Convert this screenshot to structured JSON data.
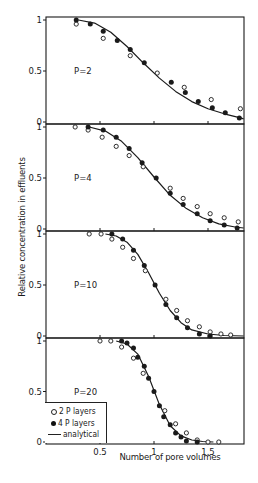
{
  "chart_data": {
    "type": "scatter",
    "title": "",
    "xlabel": "Number of pore volumes",
    "ylabel": "Relative concentration in effluents",
    "xlim": [
      0,
      1.83
    ],
    "ylim": [
      0,
      1
    ],
    "x_ticks": [
      0.5,
      1,
      1.5
    ],
    "x_tick_labels": [
      "0.5",
      "1",
      "1.5"
    ],
    "y_ticks": [
      0,
      0.5,
      1
    ],
    "y_tick_labels": [
      "0",
      "0.5",
      "1"
    ],
    "grid": false,
    "legend": {
      "position": "lower-left of bottom panel",
      "entries": [
        {
          "marker": "open-circle",
          "label": "2 P layers"
        },
        {
          "marker": "filled-circle",
          "label": "4 P layers"
        },
        {
          "marker": "line",
          "label": "analytical"
        }
      ]
    },
    "panels": [
      {
        "label": "P=2",
        "series": [
          {
            "name": "2 P layers",
            "marker": "open",
            "x": [
              0.28,
              0.53,
              0.78,
              1.03,
              1.28,
              1.53,
              1.8
            ],
            "y": [
              0.96,
              0.82,
              0.65,
              0.48,
              0.34,
              0.22,
              0.13
            ]
          },
          {
            "name": "4 P layers",
            "marker": "filled",
            "x": [
              0.28,
              0.41,
              0.53,
              0.66,
              0.78,
              0.91,
              1.16,
              1.29,
              1.41,
              1.54,
              1.66,
              1.79
            ],
            "y": [
              1.0,
              0.96,
              0.89,
              0.8,
              0.71,
              0.58,
              0.39,
              0.29,
              0.2,
              0.14,
              0.09,
              0.04
            ]
          },
          {
            "name": "analytical",
            "marker": "line",
            "x": [
              0.3,
              0.45,
              0.6,
              0.75,
              0.9,
              1.05,
              1.2,
              1.35,
              1.5,
              1.65,
              1.8,
              1.83
            ],
            "y": [
              1.0,
              0.97,
              0.88,
              0.74,
              0.58,
              0.43,
              0.3,
              0.2,
              0.13,
              0.08,
              0.04,
              0.03
            ]
          }
        ]
      },
      {
        "label": "P=4",
        "series": [
          {
            "name": "2 P layers",
            "marker": "open",
            "x": [
              0.27,
              0.39,
              0.52,
              0.65,
              0.77,
              0.9,
              1.15,
              1.27,
              1.4,
              1.52,
              1.65,
              1.78
            ],
            "y": [
              1.0,
              0.97,
              0.9,
              0.81,
              0.72,
              0.61,
              0.4,
              0.3,
              0.22,
              0.15,
              0.11,
              0.07
            ]
          },
          {
            "name": "4 P layers",
            "marker": "filled",
            "x": [
              0.39,
              0.53,
              0.65,
              0.77,
              0.89,
              1.02,
              1.15,
              1.27,
              1.4,
              1.52,
              1.65,
              1.77
            ],
            "y": [
              1.0,
              0.97,
              0.9,
              0.79,
              0.65,
              0.5,
              0.35,
              0.24,
              0.15,
              0.08,
              0.04,
              0.01
            ]
          },
          {
            "name": "analytical",
            "marker": "line",
            "x": [
              0.4,
              0.55,
              0.7,
              0.85,
              1.0,
              1.15,
              1.3,
              1.45,
              1.6,
              1.75,
              1.83
            ],
            "y": [
              1.0,
              0.96,
              0.86,
              0.7,
              0.51,
              0.33,
              0.2,
              0.11,
              0.05,
              0.02,
              0.01
            ]
          }
        ]
      },
      {
        "label": "P=10",
        "series": [
          {
            "name": "2 P layers",
            "marker": "open",
            "x": [
              0.4,
              0.51,
              0.61,
              0.71,
              0.81,
              0.92,
              1.11,
              1.21,
              1.31,
              1.42,
              1.52,
              1.62,
              1.71
            ],
            "y": [
              1.0,
              1.0,
              0.95,
              0.87,
              0.76,
              0.64,
              0.36,
              0.25,
              0.15,
              0.09,
              0.04,
              0.02,
              0.01
            ]
          },
          {
            "name": "4 P layers",
            "marker": "filled",
            "x": [
              0.61,
              0.71,
              0.81,
              0.91,
              1.01,
              1.11,
              1.21,
              1.31,
              1.42,
              1.52
            ],
            "y": [
              1.0,
              0.95,
              0.84,
              0.69,
              0.5,
              0.31,
              0.18,
              0.08,
              0.02,
              0.0
            ]
          },
          {
            "name": "analytical",
            "marker": "line",
            "x": [
              0.55,
              0.65,
              0.75,
              0.85,
              0.95,
              1.05,
              1.15,
              1.25,
              1.35,
              1.5,
              1.65,
              1.83
            ],
            "y": [
              1.0,
              0.98,
              0.92,
              0.8,
              0.62,
              0.42,
              0.25,
              0.13,
              0.06,
              0.02,
              0.005,
              0.0
            ]
          }
        ]
      },
      {
        "label": "P=20",
        "series": [
          {
            "name": "2 P layers",
            "marker": "open",
            "x": [
              0.5,
              0.6,
              0.7,
              0.81,
              0.9,
              1.1,
              1.2,
              1.3,
              1.4,
              1.5,
              1.6
            ],
            "y": [
              1.0,
              1.0,
              0.94,
              0.83,
              0.68,
              0.31,
              0.18,
              0.09,
              0.02,
              0.0,
              0.0
            ]
          },
          {
            "name": "4 P layers",
            "marker": "filled",
            "x": [
              0.7,
              0.75,
              0.81,
              0.85,
              0.91,
              0.95,
              1.0,
              1.05,
              1.09,
              1.15,
              1.2,
              1.25,
              1.3,
              1.4
            ],
            "y": [
              1.0,
              0.98,
              0.93,
              0.84,
              0.75,
              0.63,
              0.5,
              0.36,
              0.25,
              0.17,
              0.09,
              0.05,
              0.01,
              0.0
            ]
          },
          {
            "name": "analytical",
            "marker": "line",
            "x": [
              0.65,
              0.75,
              0.85,
              0.95,
              1.0,
              1.05,
              1.15,
              1.25,
              1.35,
              1.45,
              1.55
            ],
            "y": [
              1.0,
              0.97,
              0.87,
              0.65,
              0.51,
              0.37,
              0.16,
              0.06,
              0.02,
              0.005,
              0.0
            ]
          }
        ]
      }
    ]
  },
  "labels": {
    "ylabel": "Relative concentration in effluents",
    "xlabel": "Number of pore volumes",
    "legend_open": "2 P layers",
    "legend_filled": "4 P layers",
    "legend_line": "analytical"
  },
  "colors": {
    "ink": "#1a1a1a",
    "background": "#ffffff"
  }
}
